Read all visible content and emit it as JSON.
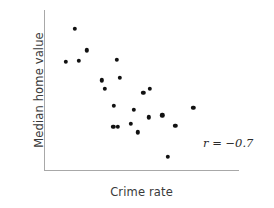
{
  "chart_data": {
    "type": "scatter",
    "title": "",
    "xlabel": "Crime rate",
    "ylabel": "Median home value",
    "annotation": "r = −0.7",
    "correlation": -0.7,
    "grid": false,
    "legend": "none",
    "axis_style": "open L-shaped axes, no tick marks, no tick labels",
    "xlim": [
      0,
      1
    ],
    "ylim": [
      0,
      1
    ],
    "n_points": 21,
    "points": [
      {
        "x": 0.144,
        "y": 0.915
      },
      {
        "x": 0.21,
        "y": 0.771
      },
      {
        "x": 0.097,
        "y": 0.696
      },
      {
        "x": 0.169,
        "y": 0.702
      },
      {
        "x": 0.374,
        "y": 0.709
      },
      {
        "x": 0.292,
        "y": 0.571
      },
      {
        "x": 0.39,
        "y": 0.59
      },
      {
        "x": 0.308,
        "y": 0.515
      },
      {
        "x": 0.518,
        "y": 0.489
      },
      {
        "x": 0.554,
        "y": 0.515
      },
      {
        "x": 0.359,
        "y": 0.401
      },
      {
        "x": 0.467,
        "y": 0.375
      },
      {
        "x": 0.549,
        "y": 0.325
      },
      {
        "x": 0.621,
        "y": 0.338
      },
      {
        "x": 0.79,
        "y": 0.388
      },
      {
        "x": 0.354,
        "y": 0.262
      },
      {
        "x": 0.379,
        "y": 0.262
      },
      {
        "x": 0.451,
        "y": 0.281
      },
      {
        "x": 0.692,
        "y": 0.269
      },
      {
        "x": 0.487,
        "y": 0.225
      },
      {
        "x": 0.651,
        "y": 0.063
      }
    ],
    "colors": {
      "point": "#111111",
      "axis": "#a8a8a8",
      "label_text": "#3a3a3a",
      "annotation_text": "#2b2b2b",
      "background": "#ffffff"
    }
  }
}
